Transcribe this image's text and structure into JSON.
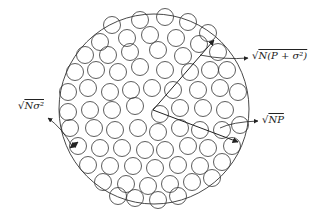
{
  "diagram": {
    "type": "sphere-packing",
    "outer_circle": {
      "cx": 154,
      "cy": 109,
      "r": 95
    },
    "small_circle_radius": 8.5,
    "stroke_color": "#333333",
    "labels": {
      "outer_radius": {
        "radical": "√",
        "text": "N(P + σ²)"
      },
      "signal_radius": {
        "radical": "√",
        "text": "NP"
      },
      "noise_radius": {
        "radical": "√",
        "text": "Nσ²"
      }
    },
    "arrows": [
      {
        "name": "outer-radius-arrow",
        "from": [
          153,
          110
        ],
        "to": [
          214,
          40
        ]
      },
      {
        "name": "signal-radius-arrow",
        "from": [
          153,
          110
        ],
        "to": [
          238,
          142
        ]
      }
    ],
    "small_circles": [
      [
        112,
        25
      ],
      [
        140,
        20
      ],
      [
        165,
        17
      ],
      [
        188,
        22
      ],
      [
        208,
        33
      ],
      [
        127,
        38
      ],
      [
        150,
        35
      ],
      [
        176,
        38
      ],
      [
        199,
        44
      ],
      [
        100,
        42
      ],
      [
        85,
        55
      ],
      [
        108,
        55
      ],
      [
        130,
        52
      ],
      [
        158,
        50
      ],
      [
        183,
        56
      ],
      [
        218,
        52
      ],
      [
        227,
        70
      ],
      [
        75,
        72
      ],
      [
        96,
        70
      ],
      [
        118,
        72
      ],
      [
        140,
        67
      ],
      [
        165,
        70
      ],
      [
        190,
        72
      ],
      [
        210,
        70
      ],
      [
        68,
        92
      ],
      [
        88,
        88
      ],
      [
        110,
        92
      ],
      [
        131,
        90
      ],
      [
        152,
        88
      ],
      [
        173,
        90
      ],
      [
        198,
        90
      ],
      [
        220,
        88
      ],
      [
        238,
        92
      ],
      [
        68,
        112
      ],
      [
        90,
        110
      ],
      [
        112,
        110
      ],
      [
        135,
        106
      ],
      [
        160,
        114
      ],
      [
        180,
        108
      ],
      [
        203,
        108
      ],
      [
        225,
        110
      ],
      [
        70,
        128
      ],
      [
        94,
        128
      ],
      [
        115,
        130
      ],
      [
        138,
        128
      ],
      [
        158,
        132
      ],
      [
        180,
        128
      ],
      [
        200,
        130
      ],
      [
        222,
        130
      ],
      [
        240,
        125
      ],
      [
        78,
        146
      ],
      [
        100,
        148
      ],
      [
        122,
        148
      ],
      [
        145,
        150
      ],
      [
        165,
        150
      ],
      [
        188,
        146
      ],
      [
        208,
        148
      ],
      [
        232,
        146
      ],
      [
        88,
        165
      ],
      [
        110,
        166
      ],
      [
        133,
        166
      ],
      [
        155,
        168
      ],
      [
        178,
        165
      ],
      [
        200,
        166
      ],
      [
        222,
        162
      ],
      [
        103,
        182
      ],
      [
        126,
        184
      ],
      [
        148,
        186
      ],
      [
        170,
        184
      ],
      [
        192,
        182
      ],
      [
        212,
        178
      ],
      [
        135,
        198
      ],
      [
        158,
        200
      ],
      [
        178,
        196
      ],
      [
        118,
        196
      ]
    ]
  }
}
